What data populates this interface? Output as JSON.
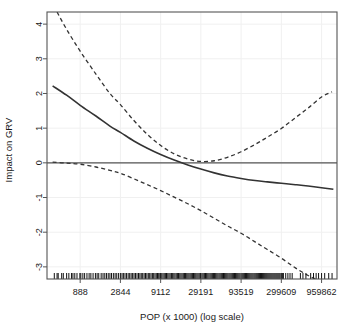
{
  "chart_data": {
    "type": "line",
    "title": "",
    "subtitle": "",
    "xlabel": "POP (x 1000) (log scale)",
    "ylabel": "Impact on GRV",
    "grid": true,
    "legend_position": "none",
    "x_scale": "log",
    "x_tick_labels": [
      "888",
      "2844",
      "9112",
      "29191",
      "93519",
      "299609",
      "959862"
    ],
    "x_tick_values": [
      888,
      2844,
      9112,
      29191,
      93519,
      299609,
      959862
    ],
    "y_tick_labels": [
      "4",
      "3",
      "2",
      "1",
      "0",
      "-1",
      "-2",
      "-3"
    ],
    "y_tick_values": [
      4,
      3,
      2,
      1,
      0,
      -1,
      -2,
      -3
    ],
    "xlim": [
      340,
      1500000
    ],
    "ylim": [
      -3.35,
      4.35
    ],
    "annotations": [
      "Horizontal solid reference line at y = 0",
      "Rug plot of observations along bottom axis"
    ],
    "series": [
      {
        "name": "Estimated effect",
        "style": "solid",
        "color": "#333333",
        "x": [
          400,
          600,
          888,
          1400,
          2100,
          2844,
          4200,
          6200,
          9112,
          13500,
          20000,
          29191,
          43000,
          63000,
          93519,
          140000,
          200000,
          299609,
          450000,
          650000,
          959862,
          1350000
        ],
        "y": [
          2.22,
          1.95,
          1.66,
          1.35,
          1.06,
          0.88,
          0.63,
          0.42,
          0.24,
          0.08,
          -0.06,
          -0.18,
          -0.29,
          -0.38,
          -0.45,
          -0.51,
          -0.55,
          -0.59,
          -0.63,
          -0.67,
          -0.72,
          -0.76
        ]
      },
      {
        "name": "Upper 95% confidence band",
        "style": "dashed",
        "color": "#333333",
        "x": [
          455,
          600,
          888,
          1400,
          2100,
          2844,
          4200,
          6200,
          9112,
          13500,
          20000,
          29191,
          43000,
          63000,
          93519,
          140000,
          200000,
          299609,
          450000,
          650000,
          959862,
          1300000
        ],
        "y": [
          4.35,
          3.85,
          3.22,
          2.56,
          2.0,
          1.68,
          1.22,
          0.82,
          0.5,
          0.26,
          0.11,
          0.04,
          0.06,
          0.16,
          0.32,
          0.53,
          0.74,
          0.99,
          1.3,
          1.58,
          1.9,
          2.05
        ]
      },
      {
        "name": "Lower 95% confidence band",
        "style": "dashed",
        "color": "#333333",
        "x": [
          400,
          600,
          888,
          1400,
          2100,
          2844,
          4200,
          6200,
          9112,
          13500,
          20000,
          29191,
          43000,
          63000,
          93519,
          140000,
          200000,
          299609,
          450000,
          650000,
          800000
        ],
        "y": [
          0.02,
          -0.01,
          -0.04,
          -0.12,
          -0.22,
          -0.3,
          -0.46,
          -0.63,
          -0.8,
          -0.99,
          -1.18,
          -1.38,
          -1.6,
          -1.82,
          -2.03,
          -2.28,
          -2.5,
          -2.75,
          -3.03,
          -3.25,
          -3.35
        ]
      }
    ],
    "rug_x": [
      420,
      455,
      470,
      520,
      545,
      600,
      640,
      690,
      720,
      760,
      810,
      880,
      905,
      960,
      1010,
      1080,
      1150,
      1210,
      1290,
      1380,
      1450,
      1520,
      1630,
      1720,
      1810,
      1900,
      2000,
      2100,
      2200,
      2320,
      2440,
      2560,
      2700,
      2844,
      2980,
      3100,
      3250,
      3400,
      3560,
      3720,
      3880,
      4050,
      4220,
      4400,
      4600,
      4800,
      5000,
      5200,
      5420,
      5650,
      5880,
      6120,
      6380,
      6640,
      6900,
      7180,
      7450,
      7740,
      8030,
      8320,
      8620,
      8920,
      9112,
      9420,
      9760,
      10100,
      10450,
      10800,
      11200,
      11600,
      12000,
      12450,
      12900,
      13350,
      13800,
      14300,
      14800,
      15300,
      15850,
      16400,
      16950,
      17550,
      18150,
      18750,
      19400,
      20050,
      20700,
      21400,
      22100,
      22850,
      23600,
      24400,
      25200,
      26050,
      26900,
      27800,
      28700,
      29191,
      30200,
      31200,
      32300,
      33400,
      34500,
      35700,
      36900,
      38150,
      39400,
      40700,
      42000,
      43400,
      44800,
      46300,
      47800,
      49400,
      51000,
      52700,
      54400,
      56200,
      58000,
      59900,
      61800,
      63800,
      65900,
      68000,
      70200,
      72500,
      74800,
      77200,
      79700,
      82300,
      84900,
      87600,
      90400,
      93519,
      96500,
      99600,
      102800,
      106100,
      109500,
      113000,
      116600,
      120300,
      124100,
      128000,
      132000,
      136200,
      140500,
      144900,
      149400,
      154100,
      158900,
      163800,
      168900,
      174100,
      179500,
      185000,
      190700,
      196500,
      202500,
      208700,
      215000,
      221500,
      228200,
      235100,
      242200,
      249500,
      257000,
      264700,
      272600,
      280800,
      289200,
      299609,
      308700,
      318000,
      340000,
      362000,
      385000,
      410000,
      520000,
      560000,
      610000,
      700000,
      760000,
      820000,
      880000,
      959862,
      1050000,
      1180000,
      1300000
    ]
  },
  "axes": {
    "y_axis_title": "Impact on GRV",
    "x_axis_title": "POP (x 1000) (log scale)"
  },
  "colors": {
    "line": "#333333",
    "band": "#333333",
    "zero_line": "#555555",
    "grid": "#f0f0f0",
    "axis": "#555555",
    "text": "#1a1a1a",
    "background": "#ffffff"
  }
}
